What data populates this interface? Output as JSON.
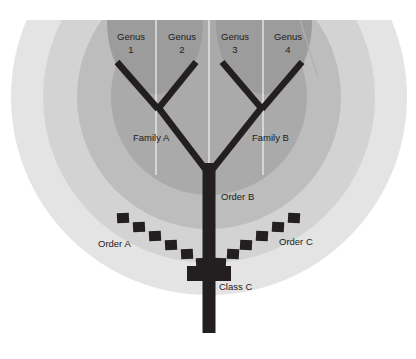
{
  "diagram": {
    "type": "phylogenetic-tree-with-rank-bands",
    "canvas": {
      "width": 416,
      "height": 359,
      "background": "#ffffff"
    },
    "colors": {
      "band_outer": "#e3e4e3",
      "band_mid": "#d2d3d2",
      "band_inner": "#bcbdbc",
      "band_core": "#a9aaa9",
      "branch": "#231f20",
      "dashed_line": "#231f20",
      "label_text": "#1b1b1b",
      "divider_line": "#f2f2f2"
    },
    "bands": [
      {
        "name": "outer-band",
        "rank": "outermost",
        "fill": "#e3e4e3",
        "radius": 198
      },
      {
        "name": "mid-band",
        "rank": "class",
        "fill": "#d2d3d2",
        "radius": 166
      },
      {
        "name": "inner-band",
        "rank": "order",
        "fill": "#bcbdbc",
        "radius": 132
      },
      {
        "name": "core-band",
        "rank": "family-group",
        "fill": "#a9aaa9",
        "radius": 98
      }
    ],
    "family_blobs": [
      {
        "name": "family-a-blob",
        "cx": 155,
        "cy": 20,
        "rx": 48,
        "ry": 72,
        "fill": "#9b9c9b"
      },
      {
        "name": "family-b-blob",
        "cx": 264,
        "cy": 20,
        "rx": 48,
        "ry": 72,
        "fill": "#9b9c9b"
      }
    ],
    "labels": {
      "genera": [
        {
          "id": "genus-1",
          "line1": "Genus",
          "line2": "1",
          "x": 131,
          "y": 44
        },
        {
          "id": "genus-2",
          "line1": "Genus",
          "line2": "2",
          "x": 182,
          "y": 44
        },
        {
          "id": "genus-3",
          "line1": "Genus",
          "line2": "3",
          "x": 235,
          "y": 44
        },
        {
          "id": "genus-4",
          "line1": "Genus",
          "line2": "4",
          "x": 288,
          "y": 44
        }
      ],
      "families": [
        {
          "id": "family-a",
          "text": "Family A",
          "x": 133,
          "y": 141
        },
        {
          "id": "family-b",
          "text": "Family B",
          "x": 252,
          "y": 141
        }
      ],
      "orders": [
        {
          "id": "order-a",
          "text": "Order A",
          "x": 98,
          "y": 247
        },
        {
          "id": "order-b",
          "text": "Order B",
          "x": 221,
          "y": 200
        },
        {
          "id": "order-c",
          "text": "Order C",
          "x": 279,
          "y": 245
        }
      ],
      "classes": [
        {
          "id": "class-c",
          "text": "Class C",
          "x": 219,
          "y": 290
        }
      ]
    },
    "tree": {
      "trunk": {
        "name": "main-trunk",
        "x": 203,
        "y_top": 168,
        "y_bottom": 333,
        "width": 13
      },
      "root_node": {
        "name": "class-c-node",
        "x": 209,
        "y": 272,
        "width": 45,
        "height": 15
      },
      "nodes": [
        {
          "id": "root-fork",
          "x": 209,
          "y": 168
        },
        {
          "id": "family-a-node",
          "x": 157,
          "y": 108
        },
        {
          "id": "family-b-node",
          "x": 262,
          "y": 108
        }
      ],
      "tips": [
        {
          "id": "tip-genus-1",
          "x": 117,
          "y": 62
        },
        {
          "id": "tip-genus-2",
          "x": 196,
          "y": 62
        },
        {
          "id": "tip-genus-3",
          "x": 222,
          "y": 62
        },
        {
          "id": "tip-genus-4",
          "x": 302,
          "y": 62
        }
      ],
      "branch_width": 6.5
    },
    "dashed_boundary": {
      "name": "order-boundary-dashed",
      "dash_count_left": 7,
      "dash_count_right": 7,
      "apex": {
        "x": 209,
        "y": 272
      },
      "left_end": {
        "x": 120,
        "y": 218
      },
      "right_end": {
        "x": 298,
        "y": 218
      },
      "dash_size": 11
    },
    "dividers": [
      {
        "name": "genus-divider-1",
        "x": 156
      },
      {
        "name": "genus-divider-center",
        "x": 209
      },
      {
        "name": "genus-divider-3",
        "x": 263
      }
    ]
  }
}
